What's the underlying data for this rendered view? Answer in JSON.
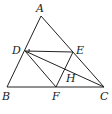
{
  "diagram": {
    "type": "geometry",
    "points": {
      "A": {
        "x": 41,
        "y": 16,
        "label": "A",
        "lx": 36,
        "ly": 12
      },
      "B": {
        "x": 7,
        "y": 87,
        "label": "B",
        "lx": 2,
        "ly": 100
      },
      "C": {
        "x": 104,
        "y": 87,
        "label": "C",
        "lx": 100,
        "ly": 100
      },
      "D": {
        "x": 25,
        "y": 51,
        "label": "D",
        "lx": 12,
        "ly": 54
      },
      "E": {
        "x": 73,
        "y": 52,
        "label": "E",
        "lx": 76,
        "ly": 54
      },
      "F": {
        "x": 56,
        "y": 87,
        "label": "F",
        "lx": 52,
        "ly": 100
      },
      "H": {
        "x": 64,
        "y": 73,
        "label": "H",
        "lx": 66,
        "ly": 82
      }
    },
    "segments": [
      [
        "A",
        "B"
      ],
      [
        "B",
        "C"
      ],
      [
        "A",
        "C"
      ],
      [
        "D",
        "E"
      ],
      [
        "D",
        "F"
      ],
      [
        "D",
        "C"
      ],
      [
        "E",
        "F"
      ]
    ],
    "labels": [
      "A",
      "B",
      "C",
      "D",
      "E",
      "F",
      "H"
    ]
  }
}
